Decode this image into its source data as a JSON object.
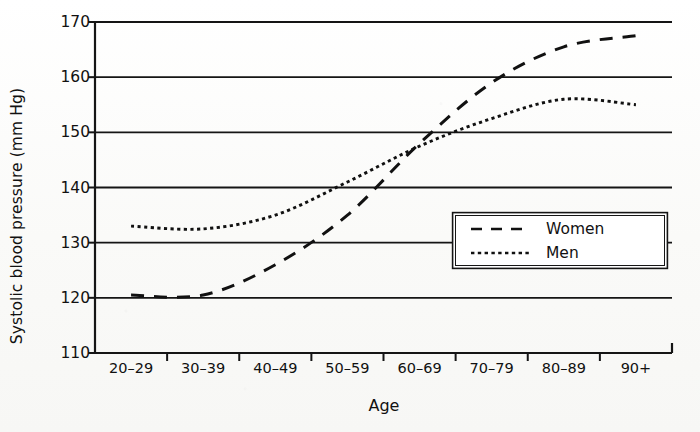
{
  "chart_data": {
    "type": "line",
    "title": "",
    "xlabel": "Age",
    "ylabel": "Systolic blood pressure (mm Hg)",
    "categories": [
      "20–29",
      "30–39",
      "40–49",
      "50–59",
      "60–69",
      "70–79",
      "80–89",
      "90+"
    ],
    "ylim": [
      110,
      170
    ],
    "yticks": [
      110,
      120,
      130,
      140,
      150,
      160,
      170
    ],
    "ytick_labels": [
      "110",
      "120",
      "130",
      "140",
      "150",
      "160",
      "170"
    ],
    "grid": "horizontal",
    "legend_position": "inside-right-lower",
    "series": [
      {
        "name": "Women",
        "style": "dashed",
        "color": "#111111",
        "values": [
          120.5,
          120.5,
          126.0,
          135.0,
          148.0,
          159.0,
          165.5,
          167.5
        ]
      },
      {
        "name": "Men",
        "style": "dotted",
        "color": "#111111",
        "values": [
          133.0,
          132.5,
          135.0,
          141.0,
          147.5,
          152.5,
          156.0,
          155.0
        ]
      }
    ]
  },
  "legend": {
    "entries": [
      {
        "label": "Women",
        "style": "dashed"
      },
      {
        "label": "Men",
        "style": "dotted"
      }
    ]
  },
  "axes": {
    "x_title": "Age",
    "y_title": "Systolic blood pressure (mm Hg)"
  }
}
